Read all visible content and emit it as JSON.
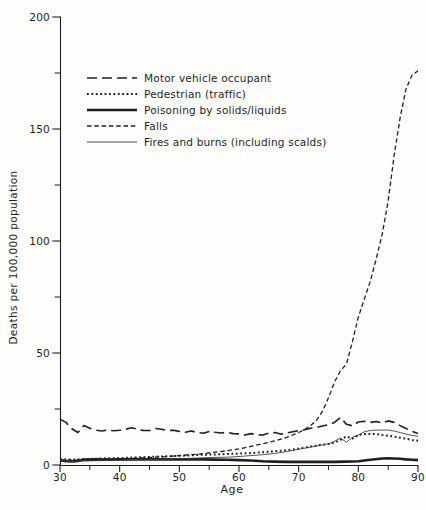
{
  "figure": {
    "background": "#fdfdfb",
    "ink_color": "#1f1f1f",
    "thin_line_color": "#3f3f3f"
  },
  "chart_data": {
    "type": "line",
    "title": "",
    "xlabel": "Age",
    "ylabel": "Deaths per 100,000 population",
    "x_range": [
      30,
      90
    ],
    "y_range": [
      0,
      200
    ],
    "x_ticks_major": [
      30,
      40,
      50,
      60,
      70,
      80,
      90
    ],
    "x_ticks_minor": [
      35,
      45,
      55,
      65,
      75,
      85
    ],
    "y_ticks_major": [
      0,
      50,
      100,
      150,
      200
    ],
    "y_ticks_minor": [
      25,
      75,
      125,
      175
    ],
    "grid": false,
    "legend_position": "upper-left-inside",
    "series": [
      {
        "name": "Motor vehicle occupant",
        "line_style": "long-dash",
        "dash": "10 5",
        "stroke_width": 1.6,
        "color": "#1f1f1f",
        "points": [
          [
            30,
            20.5
          ],
          [
            31,
            19
          ],
          [
            32,
            16.2
          ],
          [
            33,
            14.5
          ],
          [
            34,
            17.6
          ],
          [
            35,
            16.4
          ],
          [
            36,
            15.6
          ],
          [
            37,
            15.2
          ],
          [
            38,
            15.6
          ],
          [
            39,
            15.3
          ],
          [
            40,
            15.5
          ],
          [
            41,
            16
          ],
          [
            42,
            16.6
          ],
          [
            43,
            16
          ],
          [
            44,
            15.4
          ],
          [
            45,
            15.4
          ],
          [
            46,
            16.3
          ],
          [
            47,
            16
          ],
          [
            48,
            15.4
          ],
          [
            49,
            15.5
          ],
          [
            50,
            15
          ],
          [
            51,
            14.6
          ],
          [
            52,
            15.2
          ],
          [
            53,
            14.5
          ],
          [
            54,
            14.2
          ],
          [
            55,
            15
          ],
          [
            56,
            14.6
          ],
          [
            57,
            14.3
          ],
          [
            58,
            14.6
          ],
          [
            59,
            14
          ],
          [
            60,
            13.9
          ],
          [
            61,
            13.4
          ],
          [
            62,
            14
          ],
          [
            63,
            13.5
          ],
          [
            64,
            13.4
          ],
          [
            65,
            14.2
          ],
          [
            66,
            14.5
          ],
          [
            67,
            13.8
          ],
          [
            68,
            14.3
          ],
          [
            69,
            14.8
          ],
          [
            70,
            15.3
          ],
          [
            71,
            15.7
          ],
          [
            72,
            16.4
          ],
          [
            73,
            16.8
          ],
          [
            74,
            17.4
          ],
          [
            75,
            18
          ],
          [
            76,
            19
          ],
          [
            77,
            21.2
          ],
          [
            78,
            18.2
          ],
          [
            79,
            17.5
          ],
          [
            80,
            19.2
          ],
          [
            81,
            19.5
          ],
          [
            82,
            19
          ],
          [
            83,
            19.4
          ],
          [
            84,
            18.7
          ],
          [
            85,
            19.7
          ],
          [
            86,
            19
          ],
          [
            87,
            17.6
          ],
          [
            88,
            16.3
          ],
          [
            89,
            15
          ],
          [
            90,
            14
          ]
        ]
      },
      {
        "name": "Pedestrian (traffic)",
        "line_style": "dotted",
        "dash": "1.8 2.6",
        "stroke_width": 2,
        "color": "#1f1f1f",
        "points": [
          [
            30,
            2.6
          ],
          [
            32,
            2.4
          ],
          [
            34,
            2.6
          ],
          [
            36,
            2.8
          ],
          [
            38,
            3
          ],
          [
            40,
            3.1
          ],
          [
            42,
            3.3
          ],
          [
            44,
            3.5
          ],
          [
            46,
            3.7
          ],
          [
            48,
            3.9
          ],
          [
            50,
            4.1
          ],
          [
            52,
            4.3
          ],
          [
            54,
            4.6
          ],
          [
            56,
            4.7
          ],
          [
            58,
            4.9
          ],
          [
            60,
            5.1
          ],
          [
            62,
            5.3
          ],
          [
            64,
            5.7
          ],
          [
            66,
            6.1
          ],
          [
            68,
            6.6
          ],
          [
            70,
            7.3
          ],
          [
            72,
            8.2
          ],
          [
            74,
            9
          ],
          [
            75,
            9.4
          ],
          [
            76,
            10
          ],
          [
            77,
            11.2
          ],
          [
            78,
            12.8
          ],
          [
            79,
            11.8
          ],
          [
            80,
            13.4
          ],
          [
            81,
            13.8
          ],
          [
            82,
            13.9
          ],
          [
            83,
            13.8
          ],
          [
            84,
            13.4
          ],
          [
            85,
            13.1
          ],
          [
            86,
            12.7
          ],
          [
            87,
            12.2
          ],
          [
            88,
            11.7
          ],
          [
            89,
            11.2
          ],
          [
            90,
            10.8
          ]
        ]
      },
      {
        "name": "Poisoning by solids/liquids",
        "line_style": "solid-thick",
        "dash": "",
        "stroke_width": 2.6,
        "color": "#1f1f1f",
        "points": [
          [
            30,
            2.1
          ],
          [
            31,
            1.7
          ],
          [
            32,
            1.6
          ],
          [
            33,
            1.8
          ],
          [
            34,
            2.4
          ],
          [
            36,
            2.5
          ],
          [
            38,
            2.4
          ],
          [
            40,
            2.5
          ],
          [
            42,
            2.5
          ],
          [
            44,
            2.5
          ],
          [
            46,
            2.5
          ],
          [
            48,
            2.5
          ],
          [
            50,
            2.5
          ],
          [
            52,
            2.5
          ],
          [
            54,
            2.5
          ],
          [
            56,
            2.4
          ],
          [
            58,
            2.3
          ],
          [
            60,
            2.2
          ],
          [
            62,
            2
          ],
          [
            64,
            1.7
          ],
          [
            66,
            1.5
          ],
          [
            68,
            1.4
          ],
          [
            70,
            1.4
          ],
          [
            72,
            1.4
          ],
          [
            74,
            1.4
          ],
          [
            76,
            1.4
          ],
          [
            78,
            1.5
          ],
          [
            80,
            1.7
          ],
          [
            82,
            2.3
          ],
          [
            84,
            2.9
          ],
          [
            85,
            3
          ],
          [
            86,
            2.9
          ],
          [
            87,
            2.8
          ],
          [
            88,
            2.5
          ],
          [
            89,
            2.3
          ],
          [
            90,
            2.2
          ]
        ]
      },
      {
        "name": "Falls",
        "line_style": "short-dash",
        "dash": "4.5 2.8",
        "stroke_width": 1.3,
        "color": "#1f1f1f",
        "points": [
          [
            30,
            2.2
          ],
          [
            32,
            2.2
          ],
          [
            34,
            2.3
          ],
          [
            36,
            2.4
          ],
          [
            38,
            2.5
          ],
          [
            40,
            2.7
          ],
          [
            42,
            3
          ],
          [
            44,
            3.2
          ],
          [
            46,
            3.5
          ],
          [
            48,
            3.8
          ],
          [
            50,
            4.2
          ],
          [
            52,
            4.6
          ],
          [
            54,
            5.1
          ],
          [
            56,
            5.7
          ],
          [
            58,
            6.4
          ],
          [
            60,
            7.2
          ],
          [
            62,
            8.3
          ],
          [
            64,
            9.5
          ],
          [
            66,
            10.8
          ],
          [
            68,
            12.3
          ],
          [
            70,
            14.5
          ],
          [
            71,
            15.8
          ],
          [
            72,
            17.6
          ],
          [
            73,
            20
          ],
          [
            74,
            24
          ],
          [
            75,
            30
          ],
          [
            76,
            37
          ],
          [
            77,
            42
          ],
          [
            78,
            45
          ],
          [
            79,
            55
          ],
          [
            80,
            66
          ],
          [
            81,
            74
          ],
          [
            82,
            82
          ],
          [
            83,
            92
          ],
          [
            84,
            103
          ],
          [
            85,
            118
          ],
          [
            86,
            138
          ],
          [
            87,
            155
          ],
          [
            88,
            168
          ],
          [
            89,
            174
          ],
          [
            90,
            176
          ]
        ]
      },
      {
        "name": "Fires and burns (including scalds)",
        "line_style": "solid-thin",
        "dash": "",
        "stroke_width": 0.9,
        "color": "#3f3f3f",
        "points": [
          [
            30,
            1.8
          ],
          [
            32,
            1.7
          ],
          [
            34,
            1.8
          ],
          [
            36,
            1.9
          ],
          [
            38,
            2
          ],
          [
            40,
            2.1
          ],
          [
            42,
            2.3
          ],
          [
            44,
            2.4
          ],
          [
            46,
            2.5
          ],
          [
            48,
            2.7
          ],
          [
            50,
            2.9
          ],
          [
            52,
            3
          ],
          [
            54,
            3.2
          ],
          [
            56,
            3.4
          ],
          [
            58,
            3.5
          ],
          [
            60,
            3.8
          ],
          [
            62,
            4.2
          ],
          [
            64,
            4.6
          ],
          [
            66,
            5.2
          ],
          [
            68,
            6
          ],
          [
            70,
            7
          ],
          [
            72,
            8
          ],
          [
            74,
            9
          ],
          [
            75,
            9.4
          ],
          [
            76,
            10.6
          ],
          [
            77,
            12
          ],
          [
            78,
            10.2
          ],
          [
            79,
            12.4
          ],
          [
            80,
            13.3
          ],
          [
            81,
            14.8
          ],
          [
            82,
            15.4
          ],
          [
            83,
            15.6
          ],
          [
            84,
            15.6
          ],
          [
            85,
            15.6
          ],
          [
            86,
            15.2
          ],
          [
            87,
            14.5
          ],
          [
            88,
            13.8
          ],
          [
            89,
            13.2
          ],
          [
            90,
            12.8
          ]
        ]
      }
    ]
  }
}
